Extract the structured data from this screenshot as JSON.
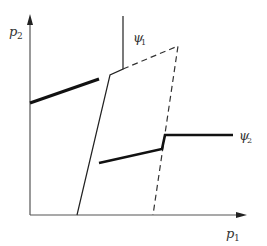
{
  "diagram": {
    "axes": {
      "x_label": "p",
      "x_label_sub": "1",
      "y_label": "p",
      "y_label_sub": "2"
    },
    "curves": {
      "psi1_label": "ψ",
      "psi1_sub": "1",
      "psi2_label": "ψ",
      "psi2_sub": "2"
    },
    "colors": {
      "line": "#1a1a1a",
      "axis": "#444444",
      "dashed": "#333333"
    }
  }
}
